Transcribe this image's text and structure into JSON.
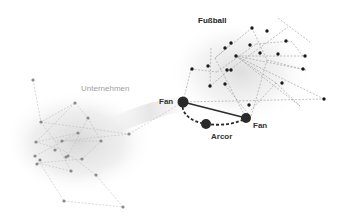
{
  "labels": {
    "cluster_left": "Unternehmen",
    "cluster_right": "Fußball",
    "node_fan_left": "Fan",
    "node_fan_right": "Fan",
    "node_arcor": "Arcor"
  },
  "colors": {
    "background": "#ffffff",
    "halo": "#d8d8d8",
    "left_nodes": "#8a8a8a",
    "right_nodes": "#1a1a1a",
    "key_nodes": "#2a2a2a",
    "left_edges": "#bdbdbd",
    "right_edges": "#9a9a9a"
  },
  "clusters": [
    {
      "name": "Unternehmen",
      "node_count": 24
    },
    {
      "name": "Fußball",
      "node_count": 26
    }
  ],
  "key_nodes": [
    {
      "label": "Fan",
      "x": 183,
      "y": 102
    },
    {
      "label": "Fan",
      "x": 246,
      "y": 118
    },
    {
      "label": "Arcor",
      "x": 206,
      "y": 124
    }
  ],
  "key_edges": [
    {
      "from": "Fan (left)",
      "to": "Fan (right)",
      "style": "solid"
    },
    {
      "from": "Fan (left)",
      "to": "Arcor",
      "style": "dashed"
    },
    {
      "from": "Arcor",
      "to": "Fan (right)",
      "style": "dashed"
    }
  ]
}
